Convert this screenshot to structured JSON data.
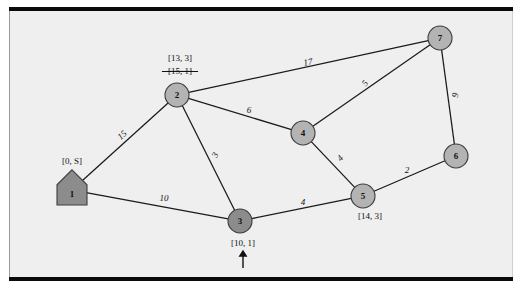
{
  "figure": {
    "kind": "weighted-undirected-graph",
    "colors": {
      "paper": "#efefef",
      "rule": "#0a0a0a",
      "edge": "#1a1a1a",
      "node_fill_open": "#b3b3b3",
      "node_fill_permanent": "#8c8c8c",
      "node_stroke": "#3c3c3c",
      "text": "#111111"
    }
  },
  "nodes": [
    {
      "id": "1",
      "label": "1",
      "shape": "pentagon",
      "state": "permanent",
      "x": 72,
      "y": 190,
      "r": 13
    },
    {
      "id": "2",
      "label": "2",
      "shape": "circle",
      "state": "open",
      "x": 177,
      "y": 95,
      "r": 12
    },
    {
      "id": "3",
      "label": "3",
      "shape": "circle",
      "state": "permanent",
      "x": 240,
      "y": 221,
      "r": 12
    },
    {
      "id": "4",
      "label": "4",
      "shape": "circle",
      "state": "open",
      "x": 303,
      "y": 133,
      "r": 12
    },
    {
      "id": "5",
      "label": "5",
      "shape": "circle",
      "state": "open",
      "x": 363,
      "y": 196,
      "r": 12
    },
    {
      "id": "6",
      "label": "6",
      "shape": "circle",
      "state": "open",
      "x": 456,
      "y": 156,
      "r": 12
    },
    {
      "id": "7",
      "label": "7",
      "shape": "circle",
      "state": "open",
      "x": 440,
      "y": 38,
      "r": 12
    }
  ],
  "edges": [
    {
      "from": "1",
      "to": "2",
      "weight": "15",
      "lx": 122,
      "ly": 135,
      "rot": -42
    },
    {
      "from": "1",
      "to": "3",
      "weight": "10",
      "lx": 164,
      "ly": 198,
      "rot": 0
    },
    {
      "from": "2",
      "to": "3",
      "weight": "3",
      "lx": 215,
      "ly": 155,
      "rot": -64
    },
    {
      "from": "2",
      "to": "4",
      "weight": "6",
      "lx": 249,
      "ly": 110,
      "rot": 0
    },
    {
      "from": "2",
      "to": "7",
      "weight": "17",
      "lx": 308,
      "ly": 62,
      "rot": -10
    },
    {
      "from": "4",
      "to": "7",
      "weight": "5",
      "lx": 365,
      "ly": 83,
      "rot": -50
    },
    {
      "from": "4",
      "to": "5",
      "weight": "4",
      "lx": 340,
      "ly": 158,
      "rot": -48
    },
    {
      "from": "3",
      "to": "5",
      "weight": "4",
      "lx": 303,
      "ly": 202,
      "rot": 0
    },
    {
      "from": "5",
      "to": "6",
      "weight": "2",
      "lx": 407,
      "ly": 170,
      "rot": 0
    },
    {
      "from": "7",
      "to": "6",
      "weight": "9",
      "lx": 455,
      "ly": 95,
      "rot": -82
    }
  ],
  "annotations": [
    {
      "node": "1",
      "text": "[0, S]",
      "x": 72,
      "y": 161,
      "struck": false
    },
    {
      "node": "2",
      "text": "[13, 3]",
      "x": 180,
      "y": 58,
      "struck": false
    },
    {
      "node": "2",
      "text": "[15, 1]",
      "x": 180,
      "y": 71,
      "struck": true
    },
    {
      "node": "3",
      "text": "[10, 1]",
      "x": 243,
      "y": 243,
      "struck": false
    },
    {
      "node": "5",
      "text": "[14, 3]",
      "x": 370,
      "y": 216,
      "struck": false
    }
  ],
  "pointer": {
    "name": "current-node-pointer",
    "target_node": "3",
    "x": 243,
    "y_tip": 251,
    "y_tail": 268
  }
}
